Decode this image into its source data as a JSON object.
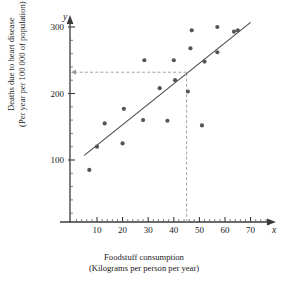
{
  "chart_data": {
    "type": "scatter",
    "title": "",
    "xlabel": "Foodstuff consumption",
    "xlabel_sub": "(Kilograms per person per year)",
    "ylabel": "Deaths due to heart disease",
    "ylabel_sub": "(Per year per 100 000 of population)",
    "x_axis_symbol": "x",
    "y_axis_symbol": "y",
    "xlim": [
      0,
      76
    ],
    "ylim": [
      0,
      315
    ],
    "x_ticks": [
      10,
      20,
      30,
      40,
      50,
      60,
      70
    ],
    "y_ticks": [
      100,
      200,
      300
    ],
    "x_minor_step": 2,
    "y_minor_step": 20,
    "grid": false,
    "legend": null,
    "points": [
      {
        "x": 7,
        "y": 85
      },
      {
        "x": 10,
        "y": 120
      },
      {
        "x": 13,
        "y": 155
      },
      {
        "x": 20,
        "y": 125
      },
      {
        "x": 20.5,
        "y": 177
      },
      {
        "x": 28,
        "y": 160
      },
      {
        "x": 28.5,
        "y": 250
      },
      {
        "x": 34.5,
        "y": 208
      },
      {
        "x": 37.5,
        "y": 159
      },
      {
        "x": 40,
        "y": 250
      },
      {
        "x": 40.5,
        "y": 220
      },
      {
        "x": 45.5,
        "y": 203
      },
      {
        "x": 46.5,
        "y": 268
      },
      {
        "x": 47,
        "y": 295
      },
      {
        "x": 51,
        "y": 152
      },
      {
        "x": 52,
        "y": 248
      },
      {
        "x": 57,
        "y": 262
      },
      {
        "x": 57,
        "y": 300
      },
      {
        "x": 63.5,
        "y": 293
      },
      {
        "x": 65,
        "y": 295
      }
    ],
    "trend_line": {
      "x1": 5,
      "y1": 107,
      "x2": 70,
      "y2": 307
    },
    "guide_lines": {
      "vertical_at_x": 45,
      "horizontal_at_y": 232,
      "arrow_direction": "left"
    },
    "point_color": "#565656",
    "line_color": "#4a4a4a",
    "axis_color": "#3a3a3a",
    "guide_color": "#9a9a9a"
  }
}
